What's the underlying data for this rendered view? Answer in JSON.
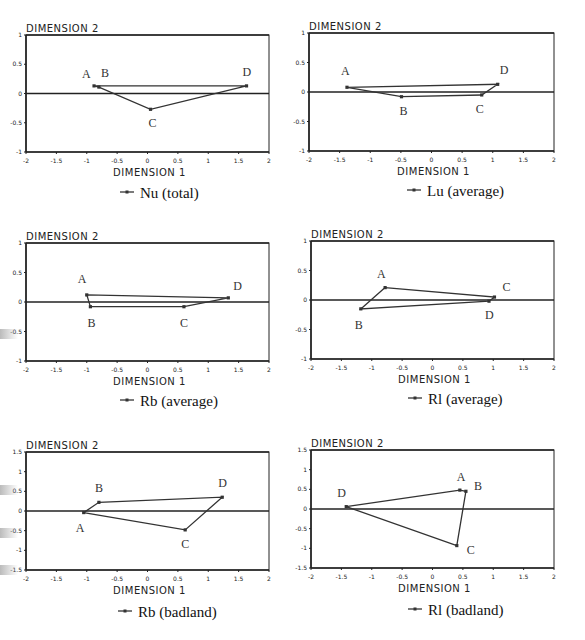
{
  "chart_data": [
    {
      "type": "scatter",
      "title": "Nu (total)",
      "legend": "Nu (total)",
      "xlabel": "DIMENSION 1",
      "ylabel": "DIMENSION 2",
      "xlim": [
        -2,
        2
      ],
      "ylim": [
        -1,
        1
      ],
      "xticks": [
        "-2",
        "-1.5",
        "-1",
        "-0.5",
        "0",
        "0.5",
        "1",
        "1.5",
        "2"
      ],
      "yticks": [
        "1",
        "0.5",
        "0",
        "-0.5",
        "-1"
      ],
      "points": [
        {
          "label": "A",
          "x": -0.88,
          "y": 0.13
        },
        {
          "label": "B",
          "x": -0.8,
          "y": 0.11
        },
        {
          "label": "C",
          "x": 0.05,
          "y": -0.27
        },
        {
          "label": "D",
          "x": 1.63,
          "y": 0.13
        }
      ],
      "polygon_order": [
        "A",
        "D",
        "C",
        "B",
        "A"
      ]
    },
    {
      "type": "scatter",
      "title": "Lu (average)",
      "legend": "Lu (average)",
      "xlabel": "DIMENSION 1",
      "ylabel": "DIMENSION 2",
      "xlim": [
        -2,
        2
      ],
      "ylim": [
        -1,
        1
      ],
      "xticks": [
        "-2",
        "-1.5",
        "-1",
        "-0.5",
        "0",
        "0.5",
        "1",
        "1.5",
        "2"
      ],
      "yticks": [
        "1",
        "0.5",
        "0",
        "-0.5",
        "-1"
      ],
      "points": [
        {
          "label": "A",
          "x": -1.38,
          "y": 0.08
        },
        {
          "label": "B",
          "x": -0.49,
          "y": -0.08
        },
        {
          "label": "C",
          "x": 0.82,
          "y": -0.05
        },
        {
          "label": "D",
          "x": 1.08,
          "y": 0.13
        }
      ],
      "polygon_order": [
        "A",
        "D",
        "C",
        "B",
        "A"
      ]
    },
    {
      "type": "scatter",
      "title": "Rb (average)",
      "legend": "Rb (average)",
      "xlabel": "DIMENSION 1",
      "ylabel": "DIMENSION 2",
      "xlim": [
        -2,
        2
      ],
      "ylim": [
        -1,
        1
      ],
      "xticks": [
        "-2",
        "-1.5",
        "-1",
        "-0.5",
        "0",
        "0.5",
        "1",
        "1.5",
        "2"
      ],
      "yticks": [
        "1",
        "0.5",
        "0",
        "-0.5",
        "-1"
      ],
      "points": [
        {
          "label": "A",
          "x": -1.0,
          "y": 0.12
        },
        {
          "label": "B",
          "x": -0.94,
          "y": -0.08
        },
        {
          "label": "C",
          "x": 0.6,
          "y": -0.08
        },
        {
          "label": "D",
          "x": 1.33,
          "y": 0.07
        }
      ],
      "polygon_order": [
        "A",
        "D",
        "C",
        "B",
        "A"
      ]
    },
    {
      "type": "scatter",
      "title": "Rl (average)",
      "legend": "Rl (average)",
      "xlabel": "DIMENSION 1",
      "ylabel": "DIMENSION 2",
      "xlim": [
        -2,
        2
      ],
      "ylim": [
        -1,
        1
      ],
      "xticks": [
        "-2",
        "-1.5",
        "-1",
        "-0.5",
        "0",
        "0.5",
        "1",
        "1.5",
        "2"
      ],
      "yticks": [
        "1",
        "0.5",
        "0",
        "-0.5",
        "-1"
      ],
      "points": [
        {
          "label": "A",
          "x": -0.78,
          "y": 0.21
        },
        {
          "label": "B",
          "x": -1.18,
          "y": -0.15
        },
        {
          "label": "C",
          "x": 1.02,
          "y": 0.05
        },
        {
          "label": "D",
          "x": 0.93,
          "y": -0.02
        }
      ],
      "polygon_order": [
        "A",
        "C",
        "D",
        "B",
        "A"
      ]
    },
    {
      "type": "scatter",
      "title": "Rb (badland)",
      "legend": "Rb (badland)",
      "xlabel": "DIMENSION 1",
      "ylabel": "DIMENSION 2",
      "xlim": [
        -2,
        2
      ],
      "ylim": [
        -1.5,
        1.5
      ],
      "xticks": [
        "-2",
        "-1.5",
        "-1",
        "-0.5",
        "0",
        "0.5",
        "1",
        "1.5",
        "2"
      ],
      "yticks": [
        "1.5",
        "1",
        "0.5",
        "0",
        "-0.5",
        "-1",
        "-1.5"
      ],
      "points": [
        {
          "label": "A",
          "x": -1.05,
          "y": -0.04
        },
        {
          "label": "B",
          "x": -0.8,
          "y": 0.22
        },
        {
          "label": "C",
          "x": 0.62,
          "y": -0.48
        },
        {
          "label": "D",
          "x": 1.23,
          "y": 0.35
        }
      ],
      "polygon_order": [
        "A",
        "B",
        "D",
        "C",
        "A"
      ]
    },
    {
      "type": "scatter",
      "title": "Rl (badland)",
      "legend": "Rl (badland)",
      "xlabel": "DIMENSION 1",
      "ylabel": "DIMENSION 2",
      "xlim": [
        -2,
        2
      ],
      "ylim": [
        -1.5,
        1.5
      ],
      "xticks": [
        "-2",
        "-1.5",
        "-1",
        "-0.5",
        "0",
        "0.5",
        "1",
        "1.5",
        "2"
      ],
      "yticks": [
        "1.5",
        "1",
        "0.5",
        "0",
        "-0.5",
        "-1",
        "-1.5"
      ],
      "points": [
        {
          "label": "A",
          "x": 0.45,
          "y": 0.48
        },
        {
          "label": "B",
          "x": 0.55,
          "y": 0.45
        },
        {
          "label": "C",
          "x": 0.4,
          "y": -0.93
        },
        {
          "label": "D",
          "x": -1.42,
          "y": 0.06
        }
      ],
      "polygon_order": [
        "D",
        "A",
        "B",
        "C",
        "D"
      ]
    }
  ],
  "layout": [
    {
      "left": 26,
      "top": 35,
      "right": 269,
      "bottom": 152,
      "legendX": 120,
      "legendY": 198
    },
    {
      "left": 309,
      "top": 33,
      "right": 554,
      "bottom": 151,
      "legendX": 407,
      "legendY": 196
    },
    {
      "left": 26,
      "top": 243,
      "right": 269,
      "bottom": 361,
      "legendX": 120,
      "legendY": 406
    },
    {
      "left": 311,
      "top": 241,
      "right": 554,
      "bottom": 359,
      "legendX": 408,
      "legendY": 404
    },
    {
      "left": 26,
      "top": 452,
      "right": 269,
      "bottom": 570,
      "legendX": 118,
      "legendY": 617
    },
    {
      "left": 311,
      "top": 450,
      "right": 554,
      "bottom": 568,
      "legendX": 408,
      "legendY": 615
    }
  ],
  "label_offsets": [
    {
      "A": [
        -12,
        -8
      ],
      "B": [
        2,
        -10
      ],
      "C": [
        -2,
        18
      ],
      "D": [
        -4,
        -10
      ]
    },
    {
      "A": [
        -6,
        -12
      ],
      "B": [
        -2,
        18
      ],
      "C": [
        -6,
        18
      ],
      "D": [
        2,
        -10
      ]
    },
    {
      "A": [
        -9,
        -12
      ],
      "B": [
        -3,
        20
      ],
      "C": [
        -4,
        20
      ],
      "D": [
        5,
        -8
      ]
    },
    {
      "A": [
        -8,
        -10
      ],
      "B": [
        -6,
        20
      ],
      "C": [
        8,
        -6
      ],
      "D": [
        -4,
        18
      ]
    },
    {
      "A": [
        -8,
        19
      ],
      "B": [
        -4,
        -10
      ],
      "C": [
        -4,
        18
      ],
      "D": [
        -4,
        -10
      ]
    },
    {
      "A": [
        -3,
        -9
      ],
      "B": [
        8,
        -1
      ],
      "C": [
        10,
        8
      ],
      "D": [
        -9,
        -10
      ]
    }
  ],
  "colors": {
    "axis": "#222222",
    "line": "#333333",
    "text": "#222222"
  }
}
